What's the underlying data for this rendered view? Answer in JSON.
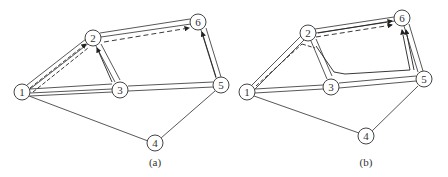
{
  "panels": [
    {
      "id": "a",
      "caption": "(a)",
      "nodes": [
        {
          "id": "1",
          "label": "1",
          "x": 22,
          "y": 92
        },
        {
          "id": "2",
          "label": "2",
          "x": 93,
          "y": 38
        },
        {
          "id": "3",
          "label": "3",
          "x": 120,
          "y": 90
        },
        {
          "id": "4",
          "label": "4",
          "x": 155,
          "y": 143
        },
        {
          "id": "5",
          "label": "5",
          "x": 221,
          "y": 85
        },
        {
          "id": "6",
          "label": "6",
          "x": 198,
          "y": 22
        }
      ],
      "caption_pos": {
        "x": 155,
        "y": 165
      }
    },
    {
      "id": "b",
      "caption": "(b)",
      "nodes": [
        {
          "id": "1",
          "label": "1",
          "x": 247,
          "y": 92
        },
        {
          "id": "2",
          "label": "2",
          "x": 308,
          "y": 33
        },
        {
          "id": "3",
          "label": "3",
          "x": 331,
          "y": 87
        },
        {
          "id": "4",
          "label": "4",
          "x": 366,
          "y": 136
        },
        {
          "id": "5",
          "label": "5",
          "x": 424,
          "y": 79
        },
        {
          "id": "6",
          "label": "6",
          "x": 402,
          "y": 18
        }
      ],
      "caption_pos": {
        "x": 366,
        "y": 165
      }
    }
  ]
}
